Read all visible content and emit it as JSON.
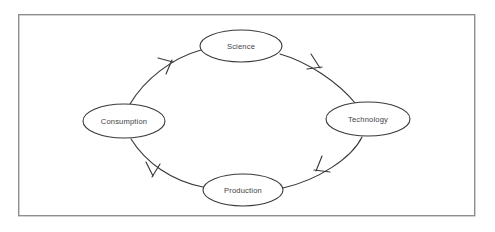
{
  "diagram": {
    "frame": {
      "name": "outer-border",
      "x": 18,
      "y": 14,
      "width": 457,
      "height": 202,
      "stroke_color": "#8d8d8d",
      "fill_color": "#ffffff"
    },
    "style": {
      "stroke_color": "#3a3a3a",
      "node_fill": "#ffffff",
      "label_color": "#41413f",
      "background": "#ffffff"
    },
    "cycle": {
      "direction": "clockwise",
      "center_x": 246,
      "center_y": 120,
      "radius_x": 82,
      "radius_y": 75
    },
    "nodes": [
      {
        "id": "science",
        "label": "Science",
        "position": "top",
        "cx": 241,
        "cy": 46,
        "rx": 41,
        "ry": 16
      },
      {
        "id": "technology",
        "label": "Technology",
        "position": "right",
        "cx": 368,
        "cy": 119,
        "rx": 42,
        "ry": 17
      },
      {
        "id": "production",
        "label": "Production",
        "position": "bottom",
        "cx": 243,
        "cy": 190,
        "rx": 40,
        "ry": 16
      },
      {
        "id": "consumption",
        "label": "Consumption",
        "position": "left",
        "cx": 124,
        "cy": 121,
        "rx": 41,
        "ry": 17
      }
    ],
    "edges": [
      {
        "id": "science-to-technology",
        "from": "science",
        "to": "technology",
        "label": "",
        "arrow": "open-v",
        "arrow_position": "top-right"
      },
      {
        "id": "technology-to-production",
        "from": "technology",
        "to": "production",
        "label": "",
        "arrow": "open-v",
        "arrow_position": "bottom-right"
      },
      {
        "id": "production-to-consumption",
        "from": "production",
        "to": "consumption",
        "label": "",
        "arrow": "open-v",
        "arrow_position": "bottom-left"
      },
      {
        "id": "consumption-to-science",
        "from": "consumption",
        "to": "science",
        "label": "",
        "arrow": "open-v",
        "arrow_position": "top-left"
      }
    ]
  }
}
